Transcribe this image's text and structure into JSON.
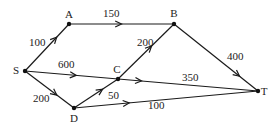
{
  "diagram": {
    "type": "directed-weighted-network",
    "nodes": [
      {
        "id": "S",
        "label": "S"
      },
      {
        "id": "A",
        "label": "A"
      },
      {
        "id": "B",
        "label": "B"
      },
      {
        "id": "C",
        "label": "C"
      },
      {
        "id": "D",
        "label": "D"
      },
      {
        "id": "T",
        "label": "T"
      }
    ],
    "edges": [
      {
        "from": "S",
        "to": "A",
        "weight": "100"
      },
      {
        "from": "A",
        "to": "B",
        "weight": "150"
      },
      {
        "from": "B",
        "to": "T",
        "weight": "400"
      },
      {
        "from": "C",
        "to": "B",
        "weight": "200"
      },
      {
        "from": "S",
        "to": "T",
        "weight": "600",
        "second_label": "350"
      },
      {
        "from": "S",
        "to": "D",
        "weight": "200"
      },
      {
        "from": "D",
        "to": "C",
        "weight": "50"
      },
      {
        "from": "D",
        "to": "T",
        "weight": "100"
      }
    ]
  }
}
